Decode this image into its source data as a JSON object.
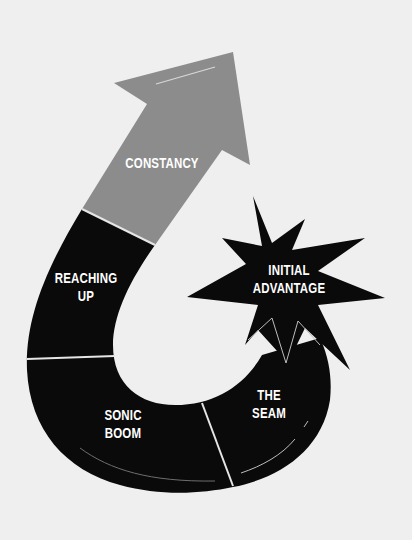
{
  "diagram": {
    "type": "curved-arrow-cycle",
    "colors": {
      "background": "#efefef",
      "arrow_head": "#8c8c8c",
      "segments": "#0a0a0a",
      "divider": "#e6e6e6",
      "text": "#ffffff"
    },
    "segments": [
      {
        "id": "constancy",
        "lines": [
          "CONSTANCY"
        ]
      },
      {
        "id": "reaching-up",
        "lines": [
          "REACHING",
          "UP"
        ]
      },
      {
        "id": "sonic-boom",
        "lines": [
          "SONIC",
          "BOOM"
        ]
      },
      {
        "id": "the-seam",
        "lines": [
          "THE",
          "SEAM"
        ]
      }
    ],
    "burst": {
      "id": "initial-advantage",
      "lines": [
        "INITIAL",
        "ADVANTAGE"
      ]
    }
  }
}
